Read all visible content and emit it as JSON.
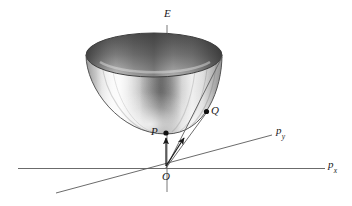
{
  "figure": {
    "type": "3d-diagram",
    "title": "",
    "background_color": "#ffffff",
    "stroke_color": "#555555",
    "text_color": "#1a1a1a"
  },
  "axes": {
    "vertical": {
      "name": "energy-axis",
      "label": "E",
      "subscript": "",
      "x": 167,
      "y_top": 25,
      "y_bottom": 192
    },
    "horizontal": {
      "name": "px-axis",
      "label": "p",
      "subscript": "x",
      "x_left": 18,
      "x_right": 325,
      "y": 168
    },
    "depth": {
      "name": "py-axis",
      "label": "p",
      "subscript": "y",
      "x_start": 56,
      "y_start": 193,
      "x_end": 272,
      "y_end": 135
    }
  },
  "origin": {
    "name": "origin",
    "label": "O",
    "x": 166,
    "y": 168
  },
  "surface": {
    "name": "paraboloid",
    "rim_center_x": 154,
    "rim_center_y": 55,
    "rim_rx": 68,
    "rim_ry": 22,
    "vertex_x": 166,
    "vertex_y": 134,
    "shading": "grayscale-gradient"
  },
  "points": [
    {
      "id": "P",
      "label": "P",
      "x": 166,
      "y": 133,
      "label_x": 151,
      "label_y": 126,
      "description": "vertex of paraboloid, rest energy state"
    },
    {
      "id": "Q",
      "label": "Q",
      "x": 206,
      "y": 112,
      "label_x": 211,
      "label_y": 105,
      "description": "point on paraboloid surface, moving state"
    }
  ],
  "arrows": [
    {
      "id": "arrow-to-P",
      "from_x": 166,
      "from_y": 166,
      "to_x": 166,
      "to_y": 137,
      "target": "P"
    },
    {
      "id": "arrow-to-Q",
      "from_x": 166,
      "from_y": 166,
      "to_x": 184,
      "to_y": 137,
      "target": "Q"
    }
  ],
  "generator_lines": [
    {
      "id": "generator-right",
      "from_x": 166,
      "from_y": 168,
      "to_x": 222,
      "to_y": 57
    },
    {
      "id": "generator-q",
      "from_x": 166,
      "from_y": 168,
      "to_x": 207,
      "to_y": 112
    }
  ]
}
